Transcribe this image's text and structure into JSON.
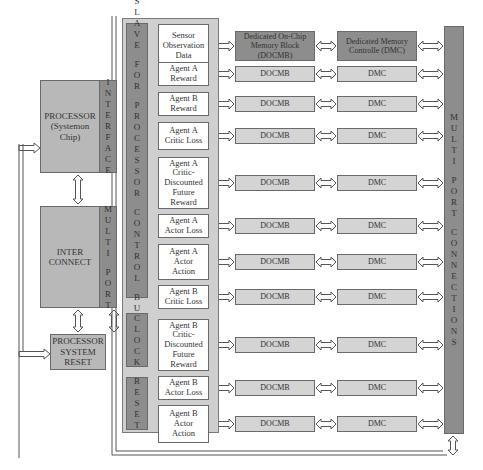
{
  "processor": {
    "title": "PROCESSOR\n(Systemon\nChip)",
    "side_label": "INTERFACE"
  },
  "interconnect": {
    "title": "INTER\nCONNECT",
    "side_label": "MULTI PORT"
  },
  "reset_block": {
    "title": "PROCESSOR\nSYSTEM\nRESET"
  },
  "bus": {
    "control_label": "SLAVE FOR PROCESSOR CONTROL BUS",
    "clock_label": "CLOCK",
    "reset_label": "RESET"
  },
  "header": {
    "docmb_full": "Dedicated On-Chip\nMemory Block\n(DOCMB)",
    "dmc_full": "Dedicated Memory\nControlle (DMC)"
  },
  "rows": [
    {
      "label": "Sensor\nObservation\nData",
      "docmb": "",
      "dmc": ""
    },
    {
      "label": "Agent A\nReward",
      "docmb": "DOCMB",
      "dmc": "DMC"
    },
    {
      "label": "Agent B\nReward",
      "docmb": "DOCMB",
      "dmc": "DMC"
    },
    {
      "label": "Agent A\nCritic Loss",
      "docmb": "DOCMB",
      "dmc": "DMC"
    },
    {
      "label": "Agent A\nCritic-\nDiscounted\nFuture\nReward",
      "docmb": "DOCMB",
      "dmc": "DMC"
    },
    {
      "label": "Agent A\nActor Loss",
      "docmb": "DOCMB",
      "dmc": "DMC"
    },
    {
      "label": "Agent A\nActor\nAction",
      "docmb": "DOCMB",
      "dmc": "DMC"
    },
    {
      "label": "Agent B\nCritic Loss",
      "docmb": "DOCMB",
      "dmc": "DMC"
    },
    {
      "label": "Agent B\nCritic-\nDiscounted\nFuture\nReward",
      "docmb": "DOCMB",
      "dmc": "DMC"
    },
    {
      "label": "Agent B\nActor Loss",
      "docmb": "DOCMB",
      "dmc": "DMC"
    },
    {
      "label": "Agent B\nActor\nAction",
      "docmb": "DOCMB",
      "dmc": "DMC"
    }
  ],
  "multiport": {
    "label": "MULTI PORT CONNECTIONS"
  },
  "colors": {
    "dark_block": "#8d8d8d",
    "medium_block": "#b8b8b8",
    "light_block": "#d4d4d4",
    "bus_panel": "#cfcfcf",
    "border": "#6a6a6a"
  }
}
